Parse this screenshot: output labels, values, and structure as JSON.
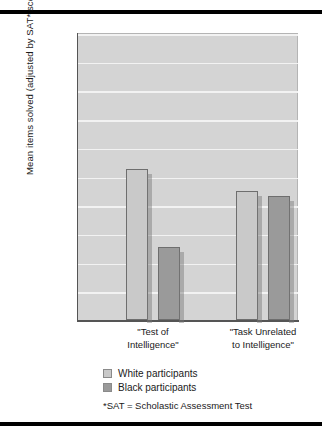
{
  "chart_data": {
    "type": "bar",
    "title": "",
    "xlabel": "",
    "ylabel": "Mean items solved (adjusted by SAT* score)",
    "ylim": [
      0,
      20
    ],
    "ytick_step": 2,
    "yticks": [
      "0",
      "2",
      "4",
      "6",
      "8",
      "10",
      "12",
      "14",
      "16",
      "18",
      "20"
    ],
    "grid": true,
    "legend_position": "below-axis-left",
    "categories": [
      "\"Test of Intelligence\"",
      "\"Task Unrelated to Intelligence\""
    ],
    "category_lines": [
      [
        "\"Test of",
        "Intelligence\""
      ],
      [
        "\"Task Unrelated",
        "to Intelligence\""
      ]
    ],
    "series": [
      {
        "name": "White participants",
        "values": [
          10.5,
          9.0
        ],
        "color": "#c9c9c9"
      },
      {
        "name": "Black participants",
        "values": [
          5.1,
          8.65
        ],
        "color": "#9a9a9a"
      }
    ],
    "annotations": [
      "*SAT = Scholastic Assessment Test"
    ]
  },
  "legend": {
    "items": [
      {
        "label": "White participants",
        "swatch": "white"
      },
      {
        "label": "Black participants",
        "swatch": "black"
      }
    ]
  },
  "footnote": "*SAT = Scholastic Assessment Test",
  "colors": {
    "plot_background": "#d4d4d4",
    "gridline": "#f2f2f2",
    "bar_white": "#c9c9c9",
    "bar_black": "#9a9a9a",
    "rule": "#000000"
  }
}
